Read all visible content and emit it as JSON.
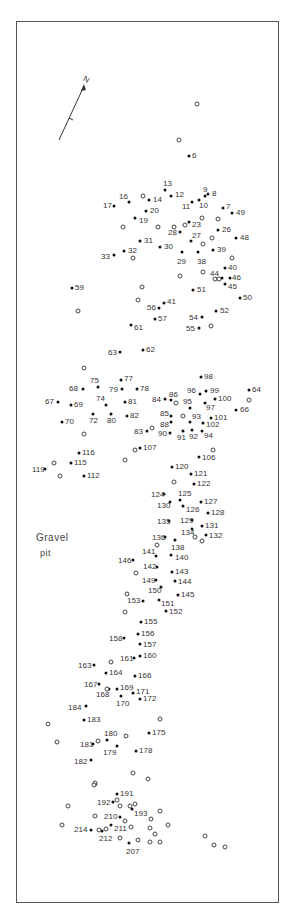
{
  "map": {
    "area_label_line1": "Gravel",
    "area_label_line2": "pit",
    "north_label": "N",
    "filled_points": [
      {
        "id": "6",
        "x": 189,
        "y": 156,
        "lx": 192,
        "ly": 152
      },
      {
        "id": "7",
        "x": 223,
        "y": 208,
        "lx": 226,
        "ly": 203
      },
      {
        "id": "8",
        "x": 208,
        "y": 194,
        "lx": 212,
        "ly": 190
      },
      {
        "id": "9",
        "x": 205,
        "y": 196,
        "lx": 203,
        "ly": 186
      },
      {
        "id": "10",
        "x": 199,
        "y": 200,
        "lx": 199,
        "ly": 202
      },
      {
        "id": "11",
        "x": 192,
        "y": 202,
        "lx": 182,
        "ly": 203
      },
      {
        "id": "12",
        "x": 171,
        "y": 196,
        "lx": 175,
        "ly": 191
      },
      {
        "id": "13",
        "x": 165,
        "y": 190,
        "lx": 163,
        "ly": 180
      },
      {
        "id": "14",
        "x": 149,
        "y": 200,
        "lx": 153,
        "ly": 196
      },
      {
        "id": "16",
        "x": 129,
        "y": 202,
        "lx": 119,
        "ly": 193
      },
      {
        "id": "17",
        "x": 114,
        "y": 206,
        "lx": 103,
        "ly": 202
      },
      {
        "id": "19",
        "x": 135,
        "y": 218,
        "lx": 139,
        "ly": 217
      },
      {
        "id": "20",
        "x": 146,
        "y": 211,
        "lx": 150,
        "ly": 207
      },
      {
        "id": "23",
        "x": 189,
        "y": 222,
        "lx": 192,
        "ly": 221
      },
      {
        "id": "26",
        "x": 218,
        "y": 230,
        "lx": 222,
        "ly": 226
      },
      {
        "id": "27",
        "x": 191,
        "y": 241,
        "lx": 192,
        "ly": 232
      },
      {
        "id": "28",
        "x": 180,
        "y": 232,
        "lx": 168,
        "ly": 229
      },
      {
        "id": "29",
        "x": 182,
        "y": 252,
        "lx": 177,
        "ly": 258
      },
      {
        "id": "30",
        "x": 160,
        "y": 247,
        "lx": 164,
        "ly": 243
      },
      {
        "id": "31",
        "x": 140,
        "y": 241,
        "lx": 144,
        "ly": 237
      },
      {
        "id": "32",
        "x": 124,
        "y": 251,
        "lx": 128,
        "ly": 247
      },
      {
        "id": "33",
        "x": 114,
        "y": 255,
        "lx": 101,
        "ly": 253
      },
      {
        "id": "38",
        "x": 198,
        "y": 252,
        "lx": 197,
        "ly": 258
      },
      {
        "id": "39",
        "x": 213,
        "y": 250,
        "lx": 217,
        "ly": 246
      },
      {
        "id": "40",
        "x": 225,
        "y": 268,
        "lx": 228,
        "ly": 264
      },
      {
        "id": "41",
        "x": 164,
        "y": 303,
        "lx": 167,
        "ly": 298
      },
      {
        "id": "44",
        "x": 222,
        "y": 278,
        "lx": 210,
        "ly": 270
      },
      {
        "id": "45",
        "x": 225,
        "y": 284,
        "lx": 228,
        "ly": 283
      },
      {
        "id": "46",
        "x": 230,
        "y": 278,
        "lx": 232,
        "ly": 274
      },
      {
        "id": "48",
        "x": 236,
        "y": 238,
        "lx": 240,
        "ly": 234
      },
      {
        "id": "49",
        "x": 232,
        "y": 213,
        "lx": 236,
        "ly": 209
      },
      {
        "id": "50",
        "x": 240,
        "y": 298,
        "lx": 243,
        "ly": 294
      },
      {
        "id": "51",
        "x": 193,
        "y": 290,
        "lx": 197,
        "ly": 286
      },
      {
        "id": "52",
        "x": 216,
        "y": 311,
        "lx": 220,
        "ly": 307
      },
      {
        "id": "54",
        "x": 202,
        "y": 317,
        "lx": 189,
        "ly": 314
      },
      {
        "id": "55",
        "x": 199,
        "y": 328,
        "lx": 186,
        "ly": 325
      },
      {
        "id": "56",
        "x": 159,
        "y": 308,
        "lx": 147,
        "ly": 304
      },
      {
        "id": "57",
        "x": 155,
        "y": 319,
        "lx": 158,
        "ly": 315
      },
      {
        "id": "59",
        "x": 72,
        "y": 288,
        "lx": 75,
        "ly": 284
      },
      {
        "id": "61",
        "x": 131,
        "y": 325,
        "lx": 134,
        "ly": 324
      },
      {
        "id": "62",
        "x": 143,
        "y": 350,
        "lx": 146,
        "ly": 346
      },
      {
        "id": "63",
        "x": 120,
        "y": 352,
        "lx": 108,
        "ly": 349
      },
      {
        "id": "64",
        "x": 249,
        "y": 390,
        "lx": 252,
        "ly": 386
      },
      {
        "id": "66",
        "x": 236,
        "y": 410,
        "lx": 240,
        "ly": 406
      },
      {
        "id": "67",
        "x": 58,
        "y": 402,
        "lx": 45,
        "ly": 398
      },
      {
        "id": "68",
        "x": 83,
        "y": 389,
        "lx": 69,
        "ly": 385
      },
      {
        "id": "69",
        "x": 71,
        "y": 405,
        "lx": 74,
        "ly": 401
      },
      {
        "id": "70",
        "x": 62,
        "y": 422,
        "lx": 65,
        "ly": 418
      },
      {
        "id": "72",
        "x": 93,
        "y": 414,
        "lx": 89,
        "ly": 417
      },
      {
        "id": "74",
        "x": 106,
        "y": 405,
        "lx": 96,
        "ly": 395
      },
      {
        "id": "75",
        "x": 98,
        "y": 387,
        "lx": 90,
        "ly": 377
      },
      {
        "id": "77",
        "x": 121,
        "y": 380,
        "lx": 124,
        "ly": 375
      },
      {
        "id": "78",
        "x": 137,
        "y": 389,
        "lx": 140,
        "ly": 385
      },
      {
        "id": "79",
        "x": 122,
        "y": 389,
        "lx": 109,
        "ly": 386
      },
      {
        "id": "80",
        "x": 111,
        "y": 414,
        "lx": 107,
        "ly": 417
      },
      {
        "id": "81",
        "x": 125,
        "y": 402,
        "lx": 128,
        "ly": 398
      },
      {
        "id": "82",
        "x": 127,
        "y": 416,
        "lx": 130,
        "ly": 412
      },
      {
        "id": "83",
        "x": 147,
        "y": 431,
        "lx": 134,
        "ly": 428
      },
      {
        "id": "84",
        "x": 165,
        "y": 399,
        "lx": 152,
        "ly": 396
      },
      {
        "id": "85",
        "x": 171,
        "y": 416,
        "lx": 160,
        "ly": 410
      },
      {
        "id": "86",
        "x": 171,
        "y": 400,
        "lx": 169,
        "ly": 391
      },
      {
        "id": "88",
        "x": 171,
        "y": 422,
        "lx": 160,
        "ly": 421
      },
      {
        "id": "90",
        "x": 170,
        "y": 433,
        "lx": 158,
        "ly": 430
      },
      {
        "id": "91",
        "x": 183,
        "y": 431,
        "lx": 177,
        "ly": 434
      },
      {
        "id": "92",
        "x": 192,
        "y": 430,
        "lx": 189,
        "ly": 433
      },
      {
        "id": "93",
        "x": 190,
        "y": 422,
        "lx": 192,
        "ly": 413
      },
      {
        "id": "94",
        "x": 202,
        "y": 431,
        "lx": 204,
        "ly": 432
      },
      {
        "id": "95",
        "x": 190,
        "y": 408,
        "lx": 183,
        "ly": 398
      },
      {
        "id": "96",
        "x": 200,
        "y": 394,
        "lx": 187,
        "ly": 387
      },
      {
        "id": "97",
        "x": 205,
        "y": 403,
        "lx": 206,
        "ly": 404
      },
      {
        "id": "98",
        "x": 201,
        "y": 377,
        "lx": 204,
        "ly": 373
      },
      {
        "id": "99",
        "x": 206,
        "y": 391,
        "lx": 210,
        "ly": 387
      },
      {
        "id": "100",
        "x": 215,
        "y": 399,
        "lx": 218,
        "ly": 395
      },
      {
        "id": "101",
        "x": 211,
        "y": 418,
        "lx": 214,
        "ly": 414
      },
      {
        "id": "102",
        "x": 203,
        "y": 423,
        "lx": 206,
        "ly": 421
      },
      {
        "id": "106",
        "x": 199,
        "y": 457,
        "lx": 202,
        "ly": 454
      },
      {
        "id": "107",
        "x": 140,
        "y": 448,
        "lx": 143,
        "ly": 444
      },
      {
        "id": "112",
        "x": 84,
        "y": 476,
        "lx": 87,
        "ly": 472
      },
      {
        "id": "115",
        "x": 71,
        "y": 463,
        "lx": 74,
        "ly": 459
      },
      {
        "id": "116",
        "x": 79,
        "y": 453,
        "lx": 82,
        "ly": 449
      },
      {
        "id": "119",
        "x": 45,
        "y": 469,
        "lx": 32,
        "ly": 466
      },
      {
        "id": "120",
        "x": 172,
        "y": 467,
        "lx": 175,
        "ly": 463
      },
      {
        "id": "121",
        "x": 191,
        "y": 474,
        "lx": 194,
        "ly": 470
      },
      {
        "id": "122",
        "x": 194,
        "y": 484,
        "lx": 197,
        "ly": 480
      },
      {
        "id": "124",
        "x": 164,
        "y": 494,
        "lx": 151,
        "ly": 491
      },
      {
        "id": "125",
        "x": 180,
        "y": 500,
        "lx": 178,
        "ly": 490
      },
      {
        "id": "126",
        "x": 183,
        "y": 506,
        "lx": 186,
        "ly": 506
      },
      {
        "id": "127",
        "x": 201,
        "y": 502,
        "lx": 204,
        "ly": 498
      },
      {
        "id": "128",
        "x": 208,
        "y": 513,
        "lx": 211,
        "ly": 509
      },
      {
        "id": "129",
        "x": 192,
        "y": 520,
        "lx": 180,
        "ly": 517
      },
      {
        "id": "130",
        "x": 170,
        "y": 502,
        "lx": 157,
        "ly": 502
      },
      {
        "id": "131",
        "x": 202,
        "y": 526,
        "lx": 205,
        "ly": 522
      },
      {
        "id": "132",
        "x": 206,
        "y": 535,
        "lx": 209,
        "ly": 532
      },
      {
        "id": "134",
        "x": 192,
        "y": 529,
        "lx": 181,
        "ly": 529
      },
      {
        "id": "135",
        "x": 169,
        "y": 521,
        "lx": 157,
        "ly": 518
      },
      {
        "id": "136",
        "x": 165,
        "y": 537,
        "lx": 152,
        "ly": 534
      },
      {
        "id": "138",
        "x": 175,
        "y": 540,
        "lx": 171,
        "ly": 544
      },
      {
        "id": "140",
        "x": 171,
        "y": 555,
        "lx": 175,
        "ly": 554
      },
      {
        "id": "141",
        "x": 156,
        "y": 556,
        "lx": 142,
        "ly": 548
      },
      {
        "id": "142",
        "x": 157,
        "y": 567,
        "lx": 143,
        "ly": 563
      },
      {
        "id": "143",
        "x": 172,
        "y": 572,
        "lx": 175,
        "ly": 568
      },
      {
        "id": "144",
        "x": 175,
        "y": 581,
        "lx": 178,
        "ly": 578
      },
      {
        "id": "145",
        "x": 178,
        "y": 595,
        "lx": 181,
        "ly": 591
      },
      {
        "id": "146",
        "x": 133,
        "y": 560,
        "lx": 118,
        "ly": 557
      },
      {
        "id": "149",
        "x": 156,
        "y": 580,
        "lx": 142,
        "ly": 577
      },
      {
        "id": "150",
        "x": 161,
        "y": 587,
        "lx": 148,
        "ly": 587
      },
      {
        "id": "151",
        "x": 159,
        "y": 600,
        "lx": 161,
        "ly": 600
      },
      {
        "id": "152",
        "x": 166,
        "y": 611,
        "lx": 169,
        "ly": 608
      },
      {
        "id": "153",
        "x": 143,
        "y": 601,
        "lx": 127,
        "ly": 597
      },
      {
        "id": "155",
        "x": 141,
        "y": 622,
        "lx": 144,
        "ly": 618
      },
      {
        "id": "156",
        "x": 138,
        "y": 634,
        "lx": 141,
        "ly": 630
      },
      {
        "id": "157",
        "x": 140,
        "y": 644,
        "lx": 143,
        "ly": 641
      },
      {
        "id": "158",
        "x": 124,
        "y": 638,
        "lx": 109,
        "ly": 635
      },
      {
        "id": "160",
        "x": 140,
        "y": 656,
        "lx": 143,
        "ly": 652
      },
      {
        "id": "161",
        "x": 134,
        "y": 658,
        "lx": 120,
        "ly": 655
      },
      {
        "id": "163",
        "x": 94,
        "y": 665,
        "lx": 78,
        "ly": 662
      },
      {
        "id": "164",
        "x": 106,
        "y": 673,
        "lx": 109,
        "ly": 669
      },
      {
        "id": "166",
        "x": 135,
        "y": 676,
        "lx": 138,
        "ly": 672
      },
      {
        "id": "167",
        "x": 99,
        "y": 684,
        "lx": 84,
        "ly": 681
      },
      {
        "id": "168",
        "x": 109,
        "y": 689,
        "lx": 96,
        "ly": 691
      },
      {
        "id": "169",
        "x": 117,
        "y": 689,
        "lx": 120,
        "ly": 684
      },
      {
        "id": "170",
        "x": 121,
        "y": 696,
        "lx": 116,
        "ly": 700
      },
      {
        "id": "171",
        "x": 133,
        "y": 693,
        "lx": 136,
        "ly": 688
      },
      {
        "id": "172",
        "x": 140,
        "y": 699,
        "lx": 143,
        "ly": 695
      },
      {
        "id": "175",
        "x": 149,
        "y": 733,
        "lx": 152,
        "ly": 729
      },
      {
        "id": "178",
        "x": 136,
        "y": 751,
        "lx": 139,
        "ly": 747
      },
      {
        "id": "179",
        "x": 117,
        "y": 746,
        "lx": 103,
        "ly": 749
      },
      {
        "id": "180",
        "x": 107,
        "y": 740,
        "lx": 104,
        "ly": 730
      },
      {
        "id": "181",
        "x": 93,
        "y": 744,
        "lx": 80,
        "ly": 741
      },
      {
        "id": "182",
        "x": 91,
        "y": 760,
        "lx": 74,
        "ly": 758
      },
      {
        "id": "183",
        "x": 84,
        "y": 720,
        "lx": 87,
        "ly": 716
      },
      {
        "id": "184",
        "x": 86,
        "y": 706,
        "lx": 68,
        "ly": 704
      },
      {
        "id": "191",
        "x": 117,
        "y": 794,
        "lx": 120,
        "ly": 790
      },
      {
        "id": "192",
        "x": 113,
        "y": 802,
        "lx": 97,
        "ly": 799
      },
      {
        "id": "193",
        "x": 132,
        "y": 809,
        "lx": 134,
        "ly": 810
      },
      {
        "id": "207",
        "x": 129,
        "y": 843,
        "lx": 126,
        "ly": 848
      },
      {
        "id": "210",
        "x": 120,
        "y": 817,
        "lx": 104,
        "ly": 813
      },
      {
        "id": "211",
        "x": 111,
        "y": 825,
        "lx": 114,
        "ly": 825
      },
      {
        "id": "212",
        "x": 102,
        "y": 831,
        "lx": 99,
        "ly": 835
      },
      {
        "id": "214",
        "x": 91,
        "y": 830,
        "lx": 74,
        "ly": 826
      }
    ],
    "open_points": [
      {
        "x": 197,
        "y": 104
      },
      {
        "x": 179,
        "y": 140
      },
      {
        "x": 143,
        "y": 196
      },
      {
        "x": 174,
        "y": 227
      },
      {
        "x": 185,
        "y": 225
      },
      {
        "x": 202,
        "y": 218
      },
      {
        "x": 218,
        "y": 219
      },
      {
        "x": 212,
        "y": 238
      },
      {
        "x": 203,
        "y": 244
      },
      {
        "x": 123,
        "y": 227
      },
      {
        "x": 158,
        "y": 227
      },
      {
        "x": 133,
        "y": 258
      },
      {
        "x": 180,
        "y": 276
      },
      {
        "x": 232,
        "y": 258
      },
      {
        "x": 203,
        "y": 272
      },
      {
        "x": 215,
        "y": 279
      },
      {
        "x": 219,
        "y": 279
      },
      {
        "x": 78,
        "y": 311
      },
      {
        "x": 138,
        "y": 300
      },
      {
        "x": 142,
        "y": 287
      },
      {
        "x": 211,
        "y": 326
      },
      {
        "x": 84,
        "y": 368
      },
      {
        "x": 176,
        "y": 403
      },
      {
        "x": 183,
        "y": 416
      },
      {
        "x": 152,
        "y": 428
      },
      {
        "x": 249,
        "y": 400
      },
      {
        "x": 84,
        "y": 434
      },
      {
        "x": 135,
        "y": 450
      },
      {
        "x": 54,
        "y": 463
      },
      {
        "x": 60,
        "y": 476
      },
      {
        "x": 125,
        "y": 460
      },
      {
        "x": 213,
        "y": 450
      },
      {
        "x": 174,
        "y": 482
      },
      {
        "x": 157,
        "y": 545
      },
      {
        "x": 195,
        "y": 537
      },
      {
        "x": 202,
        "y": 541
      },
      {
        "x": 136,
        "y": 573
      },
      {
        "x": 127,
        "y": 594
      },
      {
        "x": 125,
        "y": 612
      },
      {
        "x": 111,
        "y": 662
      },
      {
        "x": 107,
        "y": 689
      },
      {
        "x": 48,
        "y": 724
      },
      {
        "x": 57,
        "y": 742
      },
      {
        "x": 160,
        "y": 719
      },
      {
        "x": 126,
        "y": 736
      },
      {
        "x": 98,
        "y": 741
      },
      {
        "x": 133,
        "y": 773
      },
      {
        "x": 148,
        "y": 779
      },
      {
        "x": 95,
        "y": 784
      },
      {
        "x": 95,
        "y": 783
      },
      {
        "x": 94,
        "y": 785
      },
      {
        "x": 117,
        "y": 800
      },
      {
        "x": 120,
        "y": 806
      },
      {
        "x": 130,
        "y": 806
      },
      {
        "x": 135,
        "y": 804
      },
      {
        "x": 68,
        "y": 806
      },
      {
        "x": 160,
        "y": 811
      },
      {
        "x": 95,
        "y": 816
      },
      {
        "x": 125,
        "y": 821
      },
      {
        "x": 151,
        "y": 819
      },
      {
        "x": 62,
        "y": 825
      },
      {
        "x": 131,
        "y": 827
      },
      {
        "x": 150,
        "y": 828
      },
      {
        "x": 168,
        "y": 825
      },
      {
        "x": 155,
        "y": 834
      },
      {
        "x": 120,
        "y": 838
      },
      {
        "x": 138,
        "y": 840
      },
      {
        "x": 150,
        "y": 842
      },
      {
        "x": 160,
        "y": 842
      },
      {
        "x": 205,
        "y": 836
      },
      {
        "x": 214,
        "y": 845
      },
      {
        "x": 225,
        "y": 847
      },
      {
        "x": 106,
        "y": 829
      },
      {
        "x": 99,
        "y": 830
      }
    ]
  }
}
